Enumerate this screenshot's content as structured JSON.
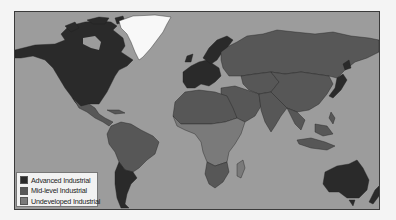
{
  "map": {
    "title": "World industrialization levels",
    "ocean_color": "#9c9c9c",
    "no_data_color": "#f8f8f8",
    "categories": [
      {
        "key": "advanced",
        "label": "Advanced Industrial",
        "color": "#2a2a2a"
      },
      {
        "key": "mid",
        "label": "Mid-level Industrial",
        "color": "#575757"
      },
      {
        "key": "undeveloped",
        "label": "Undeveloped Industrial",
        "color": "#7a7a7a"
      }
    ],
    "regions": [
      {
        "name": "North America",
        "category": "advanced"
      },
      {
        "name": "Greenland",
        "category": "none"
      },
      {
        "name": "Mexico & Central America",
        "category": "mid"
      },
      {
        "name": "Caribbean",
        "category": "mid"
      },
      {
        "name": "South America (north)",
        "category": "mid"
      },
      {
        "name": "Southern Cone",
        "category": "advanced"
      },
      {
        "name": "Western Europe",
        "category": "advanced"
      },
      {
        "name": "Scandinavia",
        "category": "advanced"
      },
      {
        "name": "Russia",
        "category": "mid"
      },
      {
        "name": "Central Asia",
        "category": "mid"
      },
      {
        "name": "China",
        "category": "mid"
      },
      {
        "name": "Japan",
        "category": "advanced"
      },
      {
        "name": "India",
        "category": "mid"
      },
      {
        "name": "Southeast Asia",
        "category": "mid"
      },
      {
        "name": "Middle East",
        "category": "mid"
      },
      {
        "name": "North Africa",
        "category": "mid"
      },
      {
        "name": "Sub-Saharan Africa",
        "category": "undeveloped"
      },
      {
        "name": "Southern Africa",
        "category": "mid"
      },
      {
        "name": "Madagascar",
        "category": "undeveloped"
      },
      {
        "name": "Australia",
        "category": "advanced"
      },
      {
        "name": "New Zealand",
        "category": "advanced"
      }
    ]
  }
}
